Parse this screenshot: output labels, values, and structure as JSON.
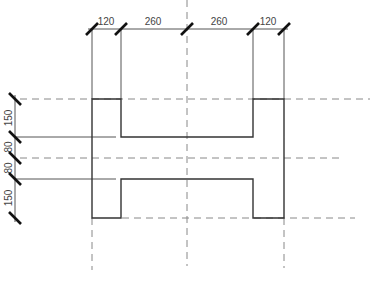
{
  "drawing": {
    "title": "I-section profile dimension drawing",
    "colors": {
      "outline": "#333333",
      "dim_line": "#555555",
      "tick": "#111111",
      "dash": "#888888",
      "text": "#444444"
    },
    "horizontal_dimensions": [
      {
        "label": "120"
      },
      {
        "label": "260"
      },
      {
        "label": "260"
      },
      {
        "label": "120"
      }
    ],
    "vertical_dimensions": [
      {
        "label": "150"
      },
      {
        "label": "80"
      },
      {
        "label": "80"
      },
      {
        "label": "150"
      }
    ]
  }
}
